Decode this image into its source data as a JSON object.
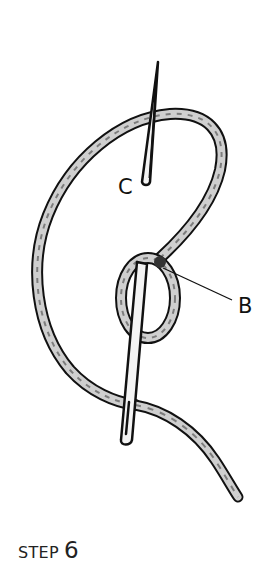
{
  "illustration": {
    "subject": "embroidery stitch: needle passing through thread loop",
    "labels": {
      "c": "C",
      "b": "B"
    }
  },
  "caption": {
    "word": "STEP",
    "number": "6"
  },
  "colors": {
    "ink": "#111111",
    "thread_fill": "#c9c9c9",
    "thread_shade": "#8a8a8a",
    "background": "#ffffff"
  }
}
